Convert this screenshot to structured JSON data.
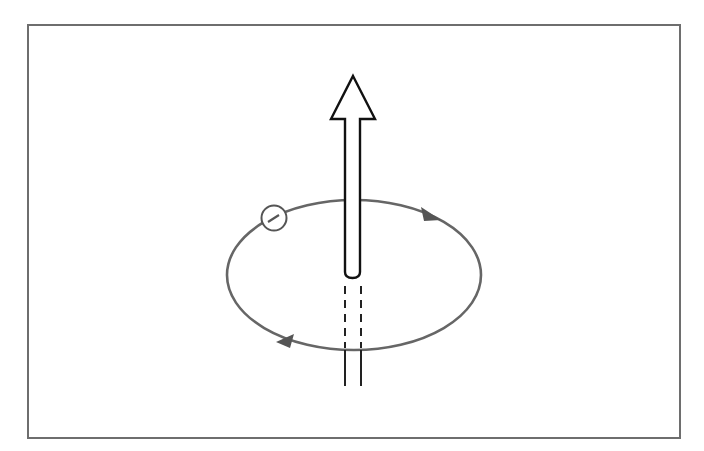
{
  "diagram": {
    "title": "Orbiting electron with magnetic moment arrow",
    "elements": {
      "frame": {
        "label": "figure-frame",
        "color": "#6e6e6e"
      },
      "arrow": {
        "label": "magnetic-moment-arrow",
        "direction": "up",
        "color": "#111111"
      },
      "orbit": {
        "label": "electron-orbit",
        "shape": "ellipse",
        "color": "#666666",
        "direction": "clockwise-when-viewed-front"
      },
      "electron": {
        "label": "electron",
        "symbol": "−",
        "color": "#555555"
      },
      "orbit_arrows": [
        {
          "label": "orbit-direction-arrow-top-right",
          "color": "#555555"
        },
        {
          "label": "orbit-direction-arrow-bottom-left",
          "color": "#555555"
        }
      ],
      "hidden_shaft": {
        "label": "hidden-arrow-shaft",
        "style": "dashed"
      }
    }
  }
}
